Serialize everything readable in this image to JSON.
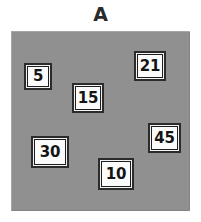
{
  "figure": {
    "title": "A",
    "panel": {
      "background_color": "#909090",
      "x": 11,
      "y": 31,
      "width": 179,
      "height": 180
    },
    "card_style": {
      "fill_color": "#fbfbfb",
      "border_color": "#1e1e1e",
      "text_color": "#141414"
    },
    "cards": [
      {
        "name": "card-5",
        "value": "5",
        "x": 24,
        "y": 63,
        "width": 28,
        "height": 27
      },
      {
        "name": "card-21",
        "value": "21",
        "x": 134,
        "y": 51,
        "width": 32,
        "height": 30
      },
      {
        "name": "card-15",
        "value": "15",
        "x": 72,
        "y": 83,
        "width": 32,
        "height": 30
      },
      {
        "name": "card-45",
        "value": "45",
        "x": 148,
        "y": 123,
        "width": 33,
        "height": 30
      },
      {
        "name": "card-30",
        "value": "30",
        "x": 31,
        "y": 136,
        "width": 38,
        "height": 32
      },
      {
        "name": "card-10",
        "value": "10",
        "x": 98,
        "y": 158,
        "width": 36,
        "height": 32
      }
    ]
  }
}
